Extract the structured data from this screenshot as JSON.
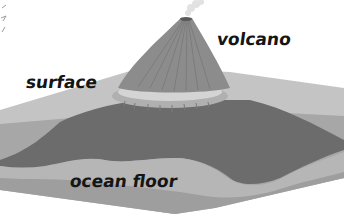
{
  "diagram": {
    "labels": {
      "volcano": "volcano",
      "surface": "surface",
      "ocean_floor": "ocean floor"
    },
    "colors": {
      "background": "#ffffff",
      "surface_plane": "#bdbdbd",
      "surface_plane_front": "#a9a9a9",
      "water_body": "#9a9a9a",
      "underwater_mound": "#6e6e6e",
      "ocean_floor_layer": "#b4b4b4",
      "ocean_floor_base": "#9c9c9c",
      "volcano_cone": "#8a8a8a",
      "volcano_rim": "#d2d2d2",
      "smoke_plume": "#e4e4e4",
      "label_text": "#151515"
    }
  }
}
